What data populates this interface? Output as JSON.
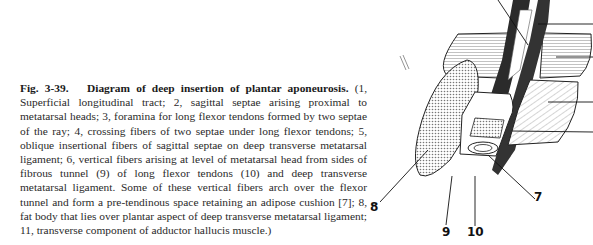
{
  "caption": {
    "figure_label": "Fig. 3-39.",
    "title": "Diagram of deep insertion of plantar aponeurosis.",
    "body": "(1, Superficial longitudinal tract; 2, sagittal septae arising proximal to metatarsal heads; 3, foramina for long flexor tendons formed by two septae of the ray; 4, crossing fibers of two septae under long flexor tendons; 5, oblique insertional fibers of sagittal septae on deep transverse metatarsal ligament; 6, vertical fibers arising at level of metatarsal head from sides of fibrous tunnel (9) of long flexor tendons (10) and deep transverse metatarsal ligament. Some of these vertical fibers arch over the flexor tunnel and form a pre-tendinous space retaining an adipose cushion [7]; 8, fat body that lies over plantar aspect of deep transverse metatarsal ligament; 11, transverse component of adductor hallucis muscle.)"
  },
  "diagram": {
    "labels": {
      "l7": "7",
      "l8": "8",
      "l9": "9",
      "l10": "10"
    }
  }
}
